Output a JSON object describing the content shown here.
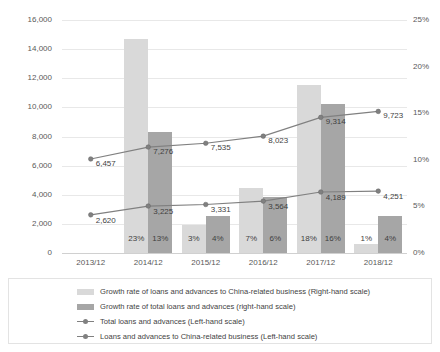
{
  "chart_data": {
    "type": "bar",
    "title": "",
    "xlabel": "",
    "ylabel": "",
    "grid": true,
    "legend_position": "bottom",
    "categories": [
      "2013/12",
      "2014/12",
      "2015/12",
      "2016/12",
      "2017/12",
      "2018/12"
    ],
    "left_axis": {
      "label": "",
      "ylim": [
        0,
        16000
      ],
      "ticks": [
        "0",
        "2,000",
        "4,000",
        "6,000",
        "8,000",
        "10,000",
        "12,000",
        "14,000",
        "16,000"
      ],
      "tick_values": [
        0,
        2000,
        4000,
        6000,
        8000,
        10000,
        12000,
        14000,
        16000
      ]
    },
    "right_axis": {
      "label": "",
      "ylim": [
        0,
        25
      ],
      "ticks": [
        "0%",
        "5%",
        "10%",
        "15%",
        "20%",
        "25%"
      ],
      "tick_values": [
        0,
        5,
        10,
        15,
        20,
        25
      ]
    },
    "series": [
      {
        "name": "Growth rate of loans and advances to China-related business (Right-hand scale)",
        "type": "bar",
        "axis": "right",
        "color": "#d9d9d9",
        "values": [
          null,
          23,
          3,
          7,
          18,
          1
        ],
        "labels": [
          "",
          "23%",
          "3%",
          "7%",
          "18%",
          "1%"
        ]
      },
      {
        "name": "Growth rate of total loans and advances (right-hand scale)",
        "type": "bar",
        "axis": "right",
        "color": "#a6a6a6",
        "values": [
          null,
          13,
          4,
          6,
          16,
          4
        ],
        "labels": [
          "",
          "13%",
          "4%",
          "6%",
          "16%",
          "4%"
        ]
      },
      {
        "name": "Total loans and advances (Left-hand scale)",
        "type": "line",
        "axis": "left",
        "color": "#808080",
        "values": [
          6457,
          7276,
          7535,
          8023,
          9314,
          9723
        ],
        "labels": [
          "6,457",
          "7,276",
          "7,535",
          "8,023",
          "9,314",
          "9,723"
        ]
      },
      {
        "name": "Loans and advances to China-related business (Left-hand scale)",
        "type": "line",
        "axis": "left",
        "color": "#808080",
        "values": [
          2620,
          3225,
          3331,
          3564,
          4189,
          4251
        ],
        "labels": [
          "2,620",
          "3,225",
          "3,331",
          "3,564",
          "4,189",
          "4,251"
        ]
      }
    ]
  }
}
